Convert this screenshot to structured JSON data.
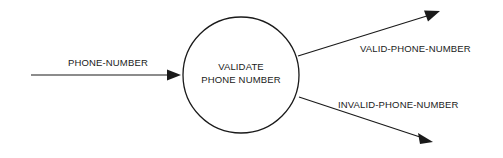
{
  "diagram": {
    "type": "data-flow-diagram",
    "background_color": "#ffffff",
    "stroke_color": "#1a1a1a",
    "process": {
      "id": "validate-phone-number",
      "shape": "circle",
      "label_line_1": "VALIDATE",
      "label_line_2": "PHONE NUMBER",
      "center_x": 241,
      "center_y": 75,
      "radius": 58
    },
    "flows": [
      {
        "id": "input-phone-number",
        "label": "PHONE-NUMBER",
        "direction": "in",
        "from_x": 31,
        "from_y": 75,
        "to_x": 182,
        "to_y": 75
      },
      {
        "id": "output-valid-phone-number",
        "label": "VALID-PHONE-NUMBER",
        "direction": "out",
        "from_x": 298,
        "from_y": 56,
        "to_x": 440,
        "to_y": 12
      },
      {
        "id": "output-invalid-phone-number",
        "label": "INVALID-PHONE-NUMBER",
        "direction": "out",
        "from_x": 299,
        "from_y": 97,
        "to_x": 433,
        "to_y": 142
      }
    ]
  }
}
